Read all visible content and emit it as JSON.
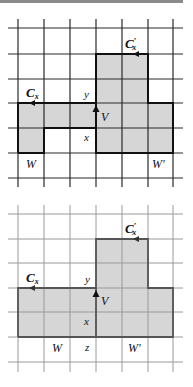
{
  "diagrams": [
    {
      "id": "top",
      "grid": {
        "x_lines": [
          18,
          44,
          70,
          96,
          122,
          148,
          173
        ],
        "y_lines": [
          28,
          54,
          79,
          103,
          128,
          153,
          178
        ],
        "line_top": 19,
        "line_bottom": 187,
        "line_left": 8,
        "line_right": 183,
        "line_color": "#222222"
      },
      "shaded_color": "#d6d6d6",
      "labels": {
        "cx": "C",
        "cx_sub": "x",
        "cxp": "C",
        "cxp_sup": "′",
        "cxp_sub": "x",
        "y": "y",
        "v": "V",
        "x": "x",
        "w": "W",
        "wp": "W′"
      }
    },
    {
      "id": "bottom",
      "grid": {
        "x_lines": [
          18,
          44,
          70,
          96,
          122,
          148,
          173
        ],
        "y_lines": [
          214,
          239,
          263,
          288,
          312,
          337,
          362
        ],
        "line_top": 205,
        "line_bottom": 372,
        "line_left": 8,
        "line_right": 183,
        "line_color": "#9a9a9a"
      },
      "shaded_color": "#d6d6d6",
      "labels": {
        "cx": "C",
        "cx_sub": "x",
        "cxp": "C",
        "cxp_sup": "′",
        "cxp_sub": "x",
        "y": "y",
        "v": "V",
        "x": "x",
        "w": "W",
        "z": "z",
        "wp": "W′"
      }
    }
  ]
}
